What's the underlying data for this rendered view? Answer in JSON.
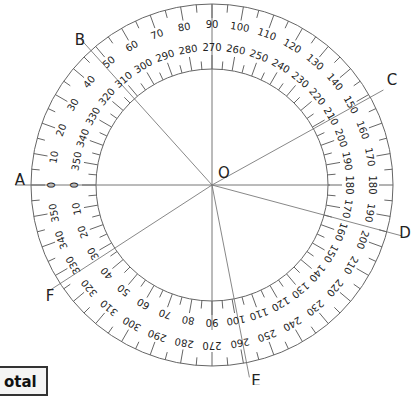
{
  "diagram": {
    "type": "protractor",
    "center_label": "O",
    "center": [
      212,
      185
    ],
    "outer_radius": 181,
    "inner_radius": 116,
    "outer_scale": {
      "start_at": "A (left)",
      "direction": "clockwise",
      "step": 10,
      "labels": [
        0,
        10,
        20,
        30,
        40,
        50,
        60,
        70,
        80,
        90,
        100,
        110,
        120,
        130,
        140,
        150,
        160,
        170,
        180,
        190,
        200,
        210,
        220,
        230,
        240,
        250,
        260,
        270,
        280,
        290,
        300,
        310,
        320,
        330,
        340,
        350
      ]
    },
    "inner_scale": {
      "start_at": "A (left)",
      "direction": "counter-clockwise",
      "step": 10,
      "labels": [
        0,
        10,
        20,
        30,
        40,
        50,
        60,
        70,
        80,
        90,
        100,
        110,
        120,
        130,
        140,
        150,
        160,
        170,
        180,
        190,
        200,
        210,
        220,
        230,
        240,
        250,
        260,
        270,
        280,
        290,
        300,
        310,
        320,
        330,
        340,
        350
      ]
    },
    "rays": [
      {
        "label": "A",
        "angle_deg": 180
      },
      {
        "label": "B",
        "angle_deg": 132
      },
      {
        "label": "C",
        "angle_deg": 29
      },
      {
        "label": "D",
        "angle_deg": -15
      },
      {
        "label": "E",
        "angle_deg": -79
      },
      {
        "label": "F",
        "angle_deg": 213
      }
    ],
    "stroke_color": "#666666",
    "text_color": "#222222"
  },
  "corner_box": {
    "text": "otal"
  }
}
